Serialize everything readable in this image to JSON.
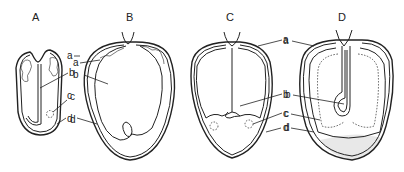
{
  "figure": {
    "panels": [
      {
        "id": "A",
        "title": "A",
        "labels": [
          "a",
          "b",
          "c",
          "d"
        ]
      },
      {
        "id": "B",
        "title": "B",
        "labels": [
          "a",
          "b",
          "c",
          "d"
        ]
      },
      {
        "id": "C",
        "title": "C",
        "labels": [
          "a",
          "b",
          "c",
          "d"
        ]
      },
      {
        "id": "D",
        "title": "D",
        "labels": [
          "a",
          "b",
          "c",
          "d"
        ]
      }
    ],
    "colors": {
      "line": "#222222",
      "background": "#ffffff",
      "stipple": "#e8e8e8"
    }
  }
}
